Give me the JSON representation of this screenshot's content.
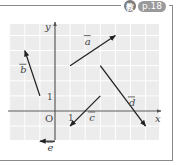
{
  "badge": {
    "icon": "教",
    "page": "p.18"
  },
  "axes": {
    "x_label": "x",
    "y_label": "y",
    "origin_label": "O",
    "x_tick": "1",
    "y_tick": "1"
  },
  "vectors": [
    {
      "name": "a",
      "from": [
        1,
        3
      ],
      "to": [
        4,
        5
      ]
    },
    {
      "name": "b",
      "from": [
        -1,
        1
      ],
      "to": [
        -2,
        4
      ]
    },
    {
      "name": "c",
      "from": [
        3,
        1
      ],
      "to": [
        1,
        -1
      ]
    },
    {
      "name": "d",
      "from": [
        3,
        3
      ],
      "to": [
        6,
        -1
      ]
    },
    {
      "name": "e",
      "from": [
        0,
        -2
      ],
      "to": [
        -1,
        -2
      ]
    }
  ],
  "colors": {
    "grid_bg": "#ececec",
    "grid_line": "#ffffff",
    "axis": "#555555",
    "vector": "#222222",
    "frame": "#8a8a8a"
  }
}
